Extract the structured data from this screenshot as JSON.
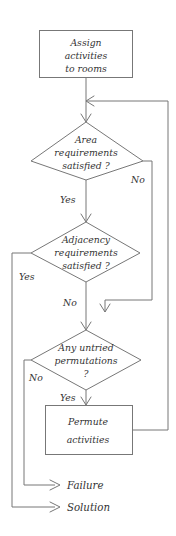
{
  "diagram": {
    "type": "flowchart",
    "colors": {
      "stroke": "#777777",
      "text": "#333333",
      "background": "#ffffff"
    },
    "nodes": {
      "start_process": {
        "shape": "process",
        "line1": "Assign",
        "line2": "activities",
        "line3": "to rooms"
      },
      "area_decision": {
        "shape": "decision",
        "line1": "Area",
        "line2": "requirements",
        "line3": "satisfied ?"
      },
      "adjacency_decision": {
        "shape": "decision",
        "line1": "Adjacency",
        "line2": "requirements",
        "line3": "satisfied ?"
      },
      "permutations_decision": {
        "shape": "decision",
        "line1": "Any untried",
        "line2": "permutations",
        "line3": "?"
      },
      "permute_process": {
        "shape": "process",
        "line1": "Permute",
        "line2": "activities"
      }
    },
    "edge_labels": {
      "area_no": "No",
      "area_yes": "Yes",
      "adjacency_yes": "Yes",
      "adjacency_no": "No",
      "permutations_no": "No",
      "permutations_yes": "Yes"
    },
    "terminals": {
      "failure": "Failure",
      "solution": "Solution"
    }
  }
}
